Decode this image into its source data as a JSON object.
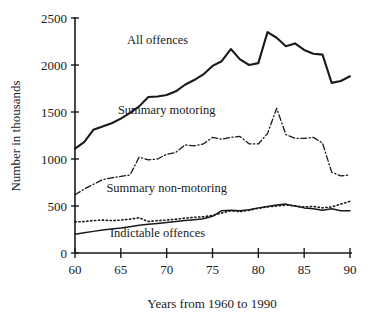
{
  "chart_data": {
    "type": "line",
    "title": "",
    "xlabel": "Years from 1960 to 1990",
    "ylabel": "Number in thousands",
    "xlim": [
      60,
      90
    ],
    "ylim": [
      0,
      2500
    ],
    "xticks": [
      60,
      65,
      70,
      75,
      80,
      85,
      90
    ],
    "yticks": [
      0,
      500,
      1000,
      1500,
      2000,
      2500
    ],
    "grid": false,
    "legend_position": "inline-annotations",
    "x": [
      60,
      61,
      62,
      63,
      64,
      65,
      66,
      67,
      68,
      69,
      70,
      71,
      72,
      73,
      74,
      75,
      76,
      77,
      78,
      79,
      80,
      81,
      82,
      83,
      84,
      85,
      86,
      87,
      88,
      89,
      90
    ],
    "series": [
      {
        "name": "All offences",
        "style": "solid",
        "label_x": 69,
        "label_y": 2220,
        "values": [
          1110,
          1180,
          1310,
          1345,
          1380,
          1430,
          1490,
          1560,
          1660,
          1665,
          1680,
          1720,
          1790,
          1840,
          1900,
          1990,
          2040,
          2170,
          2060,
          2000,
          2020,
          2350,
          2290,
          2200,
          2230,
          2160,
          2120,
          2110,
          1810,
          1830,
          1880
        ]
      },
      {
        "name": "Summary motoring",
        "style": "dashdot",
        "label_x": 70,
        "label_y": 1480,
        "values": [
          620,
          680,
          730,
          780,
          800,
          815,
          830,
          1020,
          990,
          1000,
          1050,
          1070,
          1150,
          1140,
          1160,
          1230,
          1210,
          1230,
          1240,
          1160,
          1160,
          1270,
          1540,
          1260,
          1220,
          1220,
          1230,
          1170,
          860,
          820,
          830
        ]
      },
      {
        "name": "Summary non-motoring",
        "style": "dotted",
        "label_x": 70,
        "label_y": 650,
        "values": [
          330,
          335,
          345,
          350,
          345,
          350,
          360,
          375,
          335,
          345,
          350,
          360,
          370,
          380,
          385,
          400,
          425,
          450,
          440,
          455,
          475,
          490,
          500,
          510,
          500,
          490,
          495,
          480,
          490,
          520,
          550
        ]
      },
      {
        "name": "Indictable offences",
        "style": "solid-thin",
        "label_x": 69,
        "label_y": 170,
        "values": [
          200,
          215,
          230,
          245,
          255,
          265,
          280,
          295,
          305,
          315,
          325,
          335,
          345,
          355,
          365,
          390,
          450,
          455,
          450,
          460,
          480,
          495,
          510,
          520,
          500,
          480,
          470,
          455,
          470,
          450,
          450
        ]
      }
    ]
  },
  "axis": {
    "y_tick_labels": [
      "2500",
      "2000",
      "1500",
      "1000",
      "500",
      "0"
    ],
    "x_tick_labels": [
      "60",
      "65",
      "70",
      "75",
      "80",
      "85",
      "90"
    ],
    "x_axis_title": "Years from 1960 to 1990",
    "y_axis_title": "Number in thousands"
  },
  "annotations": {
    "all_offences": "All offences",
    "summary_motoring": "Summary motoring",
    "summary_non_motoring": "Summary non-motoring",
    "indictable_offences": "Indictable offences"
  },
  "colors": {
    "ink": "#1a1a1a",
    "background": "#ffffff"
  }
}
